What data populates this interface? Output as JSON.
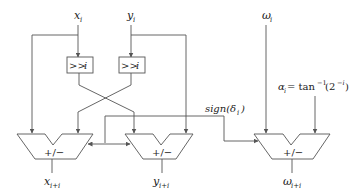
{
  "diagram": {
    "inputs": {
      "x": {
        "base": "x",
        "sub": "i"
      },
      "y": {
        "base": "y",
        "sub": "i"
      },
      "omega": {
        "base": "ω",
        "sub": "i"
      }
    },
    "shifters": {
      "left": {
        "label": ">>",
        "var": "i"
      },
      "right": {
        "label": ">>",
        "var": "i"
      }
    },
    "sign_signal": {
      "label_pre": "sign(δ",
      "sub": "i",
      "label_post": ")"
    },
    "alpha": {
      "lhs": "α",
      "lhs_sub": "i",
      "eq": " = tan",
      "sup1": "−1",
      "arg_pre": "(2",
      "sup2": "−i",
      "arg_post": ")"
    },
    "adders": {
      "x": {
        "op": "+/−"
      },
      "y": {
        "op": "+/−"
      },
      "omega": {
        "op": "+/−"
      }
    },
    "outputs": {
      "x": {
        "base": "x",
        "sub": "i+i"
      },
      "y": {
        "base": "y",
        "sub": "i+i"
      },
      "omega": {
        "base": "ω",
        "sub": "i+i"
      }
    },
    "colors": {
      "stroke": "#555555",
      "text": "#222222",
      "background": "#ffffff"
    }
  }
}
